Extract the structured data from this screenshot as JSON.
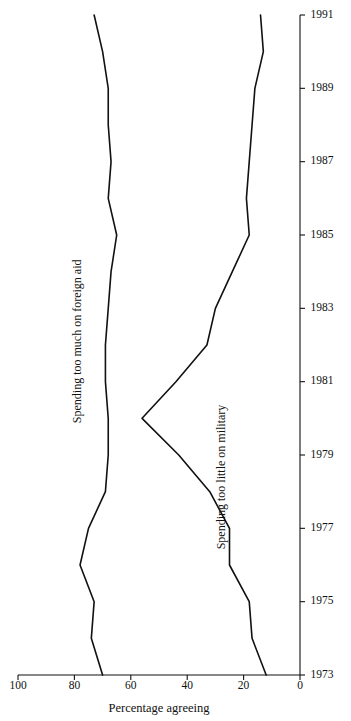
{
  "figure": {
    "background_color": "#ffffff",
    "line_color": "#111111"
  },
  "chart_data": {
    "type": "line",
    "title": "",
    "subtitle": "",
    "xlabel": "",
    "ylabel": "Percentage agreeing",
    "xlim": [
      1973,
      1991
    ],
    "ylim": [
      0,
      100
    ],
    "grid": false,
    "legend": "inline-annotations",
    "orientation": "rotated-90-ccw",
    "x": [
      1973,
      1974,
      1975,
      1976,
      1977,
      1978,
      1979,
      1980,
      1981,
      1982,
      1983,
      1984,
      1985,
      1986,
      1987,
      1988,
      1989,
      1990,
      1991
    ],
    "xticks": [
      1973,
      1975,
      1977,
      1979,
      1981,
      1983,
      1985,
      1987,
      1989,
      1991
    ],
    "xticklabels": [
      "1973",
      "1975",
      "1977",
      "1979",
      "1981",
      "1983",
      "1985",
      "1987",
      "1989",
      "1991"
    ],
    "yticks": [
      0,
      20,
      40,
      60,
      80,
      100
    ],
    "yticklabels": [
      "0",
      "20",
      "40",
      "60",
      "80",
      "100"
    ],
    "series": [
      {
        "name": "Spending too much on foreign aid",
        "label": "Spending too much on foreign aid",
        "label_x": 1982.1,
        "label_y": 78.5,
        "values": [
          70,
          74,
          73,
          78,
          75,
          69,
          68,
          68,
          69,
          69,
          68,
          67,
          65,
          68,
          67,
          68,
          68,
          70,
          73
        ]
      },
      {
        "name": "Spending too little on military",
        "label": "Spending too little on military",
        "label_x": 1978.4,
        "label_y": 27.5,
        "values": [
          12,
          17,
          18,
          25,
          25,
          32,
          43,
          56,
          44,
          33,
          30,
          24,
          18,
          19,
          18,
          17,
          16,
          13,
          14
        ]
      }
    ]
  },
  "axes": {
    "y_axis_title": "Percentage agreeing"
  }
}
